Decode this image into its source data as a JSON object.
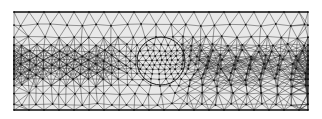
{
  "figure": {
    "type": "triangular-mesh",
    "domain_rect": {
      "x0": 14,
      "y0": 12,
      "x1": 308,
      "y1": 110
    },
    "refinement_circle": {
      "cx": 161,
      "cy": 61,
      "r": 24
    },
    "refinement_zone": {
      "rx": 52,
      "ry": 38
    },
    "colors": {
      "background": "#ffffff",
      "domain_fill": "#e9e9e9",
      "edge": "#2a2a2a",
      "node": "#111111",
      "boundary": "#1a1a1a"
    },
    "coarse_spacing": 15,
    "fine_spacing": 5
  }
}
